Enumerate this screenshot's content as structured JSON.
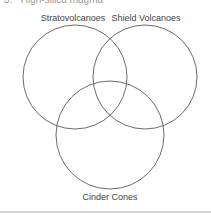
{
  "heading": {
    "number": "3.",
    "text": "High-silica magma"
  },
  "venn": {
    "stroke_color": "#6b6b6b",
    "sets": [
      {
        "label": "Stratovolcanoes",
        "cx": 75,
        "cy": 77,
        "r": 52
      },
      {
        "label": "Shield Volcanoes",
        "cx": 145,
        "cy": 77,
        "r": 52
      },
      {
        "label": "Cinder Cones",
        "cx": 110,
        "cy": 135,
        "r": 54
      }
    ]
  }
}
